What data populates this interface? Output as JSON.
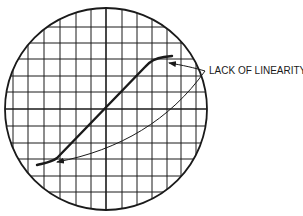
{
  "figure": {
    "caption_fragment": "",
    "annotation_label": "LACK OF LINEARITY",
    "colors": {
      "ink": "#1a1a1a",
      "background": "#ffffff"
    }
  },
  "graticule": {
    "shape": "circle",
    "center": [
      106,
      109
    ],
    "radius": 101,
    "vertical_lines_x": [
      13,
      28,
      44,
      60,
      76,
      91,
      106,
      122,
      137,
      152,
      167,
      181,
      196
    ],
    "horizontal_lines_y": [
      27,
      43,
      59,
      76,
      92,
      109,
      126,
      143,
      159,
      176,
      192
    ],
    "center_lines": {
      "x": 106,
      "y": 109
    }
  },
  "trace": {
    "description": "S-shaped transfer curve, linear middle section with flattened ends",
    "points": [
      [
        37,
        165
      ],
      [
        50,
        162
      ],
      [
        56,
        158
      ],
      [
        100,
        112
      ],
      [
        145,
        67
      ],
      [
        155,
        59
      ],
      [
        165,
        57
      ],
      [
        172,
        56
      ]
    ]
  },
  "arrows": [
    {
      "target": "upper curve end",
      "from": [
        205,
        71
      ],
      "to": [
        168,
        63
      ]
    },
    {
      "target": "lower curve end",
      "from": [
        205,
        71
      ],
      "to": [
        56,
        162
      ]
    }
  ]
}
